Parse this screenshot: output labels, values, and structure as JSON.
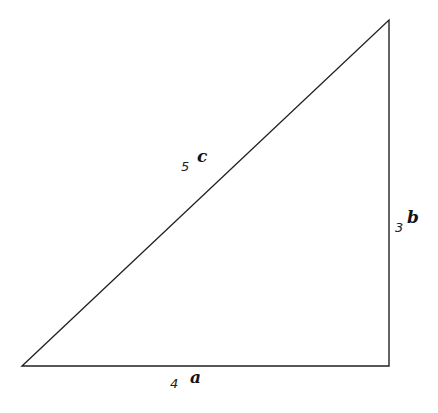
{
  "figure": {
    "kind": "right-triangle",
    "background_color": "#ffffff",
    "stroke_color": "#222222",
    "stroke_width": 1.4,
    "vertices": {
      "bottom_left": [
        22,
        366
      ],
      "bottom_right": [
        389,
        366
      ],
      "top_right": [
        389,
        20
      ]
    }
  },
  "labels": {
    "hypotenuse": {
      "value": "5",
      "name": "c"
    },
    "vertical_leg": {
      "value": "3",
      "name": "b"
    },
    "horizontal_leg": {
      "value": "4",
      "name": "a"
    }
  },
  "chart_data": {
    "type": "diagram",
    "title": "",
    "shape": "right triangle",
    "sides": [
      {
        "id": "a",
        "role": "horizontal leg (base)",
        "length": 4,
        "label": "4 a"
      },
      {
        "id": "b",
        "role": "vertical leg (height)",
        "length": 3,
        "label": "3 b"
      },
      {
        "id": "c",
        "role": "hypotenuse",
        "length": 5,
        "label": "5 c"
      }
    ],
    "relation": "a^2 + b^2 = c^2",
    "right_angle_at": "bottom-right"
  }
}
